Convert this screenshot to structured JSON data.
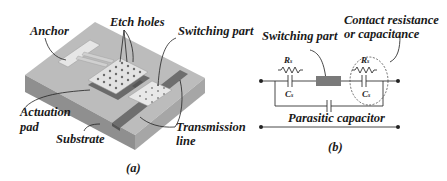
{
  "panel_a": {
    "caption": "(a)",
    "labels": {
      "anchor": "Anchor",
      "etch_holes": "Etch holes",
      "switching_part": "Switching part",
      "actuation_pad_1": "Actuation",
      "actuation_pad_2": "pad",
      "substrate": "Substrate",
      "transmission_line_1": "Transmission",
      "transmission_line_2": "line"
    }
  },
  "panel_b": {
    "caption": "(b)",
    "labels": {
      "switching_part": "Switching part",
      "contact_1": "Contact resistance",
      "contact_2": "or capacitance",
      "parasitic": "Parasitic capacitor",
      "r_left": "R",
      "r_left_sub": "s",
      "c_left": "C",
      "c_left_sub": "s",
      "r_right": "R",
      "r_right_sub": "s",
      "c_right": "C",
      "c_right_sub": "s"
    }
  },
  "colors": {
    "substrate_top": "#b9b9b9",
    "substrate_front": "#8e8e8e",
    "substrate_side": "#a3a3a3",
    "line": "#6f6f6f",
    "plate": "#dedede",
    "switch_block": "#7a7a7a"
  }
}
